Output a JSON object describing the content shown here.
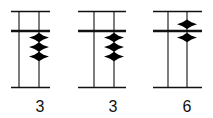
{
  "diagram": {
    "type": "abacus-rods",
    "colors": {
      "line": "#111111",
      "bead": "#000000",
      "background": "#ffffff"
    },
    "abaci": [
      {
        "label": "3",
        "frame": {
          "x1": 11,
          "x2": 50,
          "top_y": 11.5,
          "beam_y": 31,
          "bottom_y": 87.5
        },
        "rods": [
          {
            "x": 19,
            "upper_beads": 0,
            "lower_beads": 0
          },
          {
            "x": 39,
            "upper_beads": 0,
            "lower_beads": 3
          }
        ],
        "label_x": 40
      },
      {
        "label": "3",
        "frame": {
          "x1": 78,
          "x2": 126,
          "top_y": 11.5,
          "beam_y": 31,
          "bottom_y": 87.5
        },
        "rods": [
          {
            "x": 94,
            "upper_beads": 0,
            "lower_beads": 0
          },
          {
            "x": 114,
            "upper_beads": 0,
            "lower_beads": 3
          }
        ],
        "label_x": 113
      },
      {
        "label": "6",
        "frame": {
          "x1": 153,
          "x2": 202,
          "top_y": 11.5,
          "beam_y": 31,
          "bottom_y": 87.5
        },
        "rods": [
          {
            "x": 168,
            "upper_beads": 0,
            "lower_beads": 0
          },
          {
            "x": 187,
            "upper_beads": 1,
            "lower_beads": 1
          }
        ],
        "label_x": 187
      }
    ],
    "bead": {
      "width": 20,
      "height": 9.5
    }
  }
}
